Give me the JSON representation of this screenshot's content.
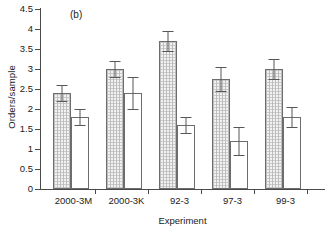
{
  "figure": {
    "panel_tag": "(b)",
    "xlabel": "Experiment",
    "ylabel": "Orders/sample"
  },
  "axes": {
    "ytick_labels": [
      "4.5",
      "4",
      "3.5",
      "3",
      "2.5",
      "2",
      "1.5",
      "1",
      "0.5",
      "0"
    ],
    "ytick_values": [
      4.5,
      4,
      3.5,
      3,
      2.5,
      2,
      1.5,
      1,
      0.5,
      0
    ]
  },
  "chart_data": {
    "type": "bar",
    "title": "(b)",
    "xlabel": "Experiment",
    "ylabel": "Orders/sample",
    "ylim": [
      0,
      4.5
    ],
    "ytick_step": 0.5,
    "grid": false,
    "legend": "none",
    "categories": [
      "2000-3M",
      "2000-3K",
      "92-3",
      "97-3",
      "99-3"
    ],
    "series": [
      {
        "name": "hatched",
        "style": "hatched",
        "values": [
          2.4,
          3.0,
          3.7,
          2.75,
          3.0
        ],
        "errors": [
          0.2,
          0.2,
          0.25,
          0.3,
          0.25
        ]
      },
      {
        "name": "open",
        "style": "open",
        "values": [
          1.8,
          2.4,
          1.6,
          1.2,
          1.8
        ],
        "errors": [
          0.2,
          0.4,
          0.2,
          0.35,
          0.25
        ]
      }
    ]
  },
  "colors": {
    "axis": "#4a4a4a",
    "bar_edge": "#6d6d6d",
    "hatch_fill": "#f2f2f2",
    "open_fill": "#ffffff",
    "error_bar": "#575757",
    "text": "#1a1a1a"
  }
}
